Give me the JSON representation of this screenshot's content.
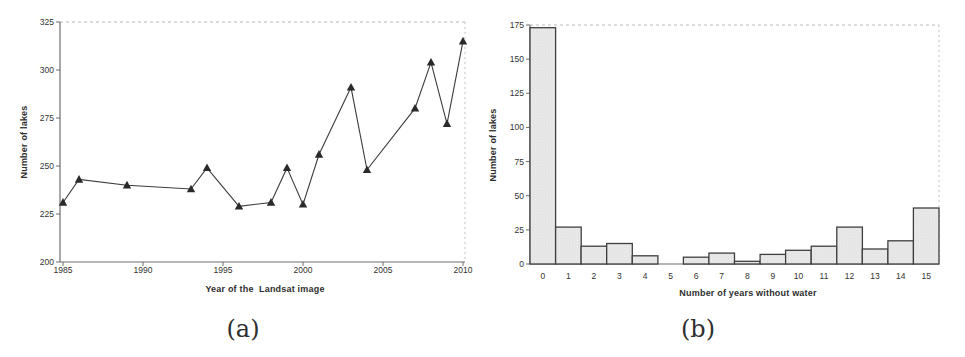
{
  "figure": {
    "type": "two-panel scanned scientific figure",
    "background_color": "#ffffff",
    "text_color": "#333333",
    "line_color": "#3c3c3c",
    "bar_fill_color": "#eaeaea",
    "bar_border_color": "#3f3f3f",
    "panel_a_caption": "(a)",
    "panel_b_caption": "(b)"
  },
  "chart_data": [
    {
      "type": "line",
      "caption": "(a)",
      "xlabel": "Year of the  Landsat image",
      "ylabel": "Number of lakes",
      "marker": "filled-triangle",
      "x": [
        1985,
        1986,
        1989,
        1993,
        1994,
        1996,
        1998,
        1999,
        2000,
        2001,
        2003,
        2004,
        2007,
        2008,
        2009,
        2010
      ],
      "y": [
        231,
        243,
        240,
        238,
        249,
        229,
        231,
        249,
        230,
        256,
        291,
        248,
        280,
        304,
        272,
        315
      ],
      "xlim": [
        1985,
        2010
      ],
      "ylim": [
        200,
        325
      ],
      "xticks": [
        1985,
        1990,
        1995,
        2000,
        2005,
        2010
      ],
      "yticks": [
        200,
        225,
        250,
        275,
        300,
        325
      ],
      "grid": "dashed top border only",
      "legend": "none"
    },
    {
      "type": "bar",
      "caption": "(b)",
      "xlabel": "Number of years without water",
      "ylabel": "Number of lakes",
      "categories": [
        "0",
        "1",
        "2",
        "3",
        "4",
        "5",
        "6",
        "7",
        "8",
        "9",
        "10",
        "11",
        "12",
        "13",
        "14",
        "15"
      ],
      "values": [
        173,
        27,
        13,
        15,
        6,
        0,
        5,
        8,
        2,
        7,
        10,
        13,
        27,
        11,
        17,
        41
      ],
      "ylim": [
        0,
        175
      ],
      "yticks": [
        0,
        25,
        50,
        75,
        100,
        125,
        150,
        175
      ],
      "bar_texture": "stippled light gray",
      "grid": "dashed top border only",
      "legend": "none"
    }
  ]
}
